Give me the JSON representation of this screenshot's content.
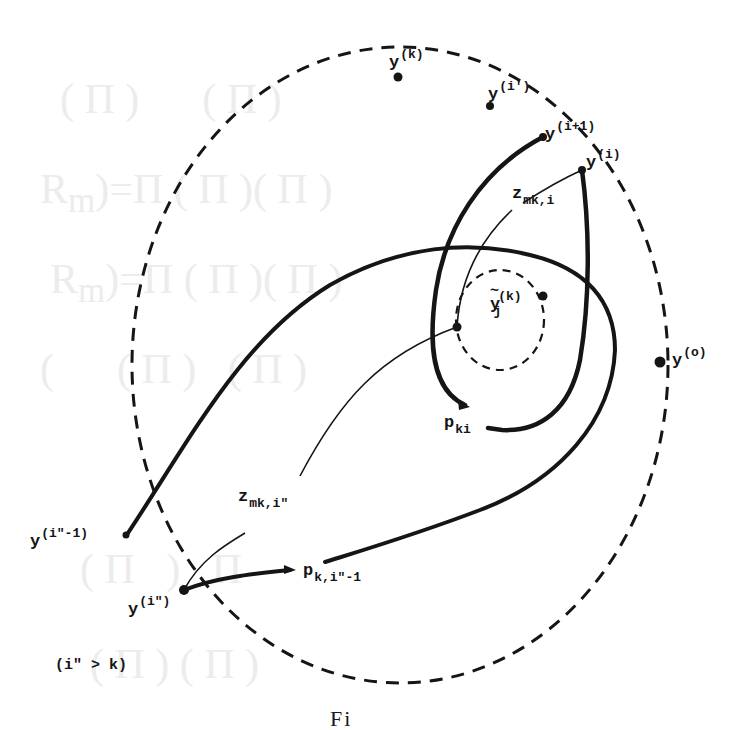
{
  "figure": {
    "caption": "Figure 5",
    "caption_visible_fragment": "Fi",
    "condition_note": "(i\" > k)"
  },
  "points": {
    "y_k": {
      "base": "y",
      "sup": "(k)"
    },
    "y_i_prime": {
      "base": "y",
      "sup": "(i')"
    },
    "y_i_plus_1": {
      "base": "y",
      "sup": "(i+1)"
    },
    "y_i": {
      "base": "y",
      "sup": "(i)"
    },
    "y_o": {
      "base": "y",
      "sup": "(o)"
    },
    "y_i2_minus_1": {
      "base": "y",
      "sup": "(i\"-1)"
    },
    "y_i2": {
      "base": "y",
      "sup": "(i\")"
    },
    "y_tilde_j_k": {
      "base": "y",
      "sup": "(k)",
      "sub": "j",
      "accent": "tilde"
    }
  },
  "paths": {
    "z_mk_i": {
      "base": "z",
      "sub": "mk,i"
    },
    "z_mk_i2": {
      "base": "z",
      "sub": "mk,i\""
    },
    "p_ki": {
      "base": "p",
      "sub": "ki"
    },
    "p_k_i2_minus_1": {
      "base": "p",
      "sub": "k,i\"-1"
    }
  },
  "style": {
    "ink": "#151515",
    "background": "#ffffff",
    "ghost_text": "#ececec"
  }
}
